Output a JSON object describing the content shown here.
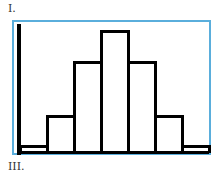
{
  "labels": {
    "top": "I.",
    "bottom": "III."
  },
  "colors": {
    "frame": "#5aaedc",
    "bars": "#000000"
  },
  "chart_data": {
    "type": "bar",
    "title": "",
    "xlabel": "",
    "ylabel": "",
    "categories": [
      "1",
      "2",
      "3",
      "4",
      "5",
      "6",
      "7"
    ],
    "values": [
      1,
      5,
      12,
      16,
      12,
      5,
      1
    ],
    "ylim": [
      0,
      17
    ],
    "grid": false,
    "legend": false
  }
}
